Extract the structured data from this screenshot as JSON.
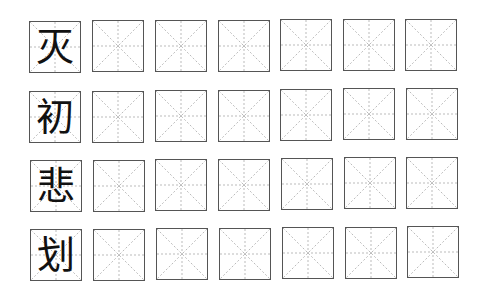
{
  "worksheet": {
    "title": "",
    "grid_type": "mi-zi-ge",
    "columns_per_row": 7,
    "rows": [
      {
        "character": "灭",
        "practice_cells": 6
      },
      {
        "character": "初",
        "practice_cells": 6
      },
      {
        "character": "悲",
        "practice_cells": 6
      },
      {
        "character": "划",
        "practice_cells": 6
      }
    ]
  },
  "colors": {
    "border": "#555555",
    "guide_lines": "#aaaaaa",
    "character": "#111111",
    "background": "#ffffff"
  }
}
